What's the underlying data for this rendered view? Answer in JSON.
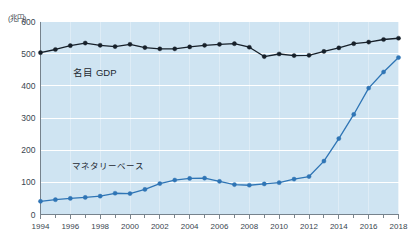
{
  "chart_data": {
    "type": "line",
    "title": "",
    "subtitle": "",
    "unit_label": "(兆円)",
    "xlabel": "",
    "ylabel": "",
    "ylim": [
      0,
      600
    ],
    "yticks": [
      0,
      100,
      200,
      300,
      400,
      500,
      600
    ],
    "ytick_labels": [
      "0",
      "100",
      "200",
      "300",
      "400",
      "500",
      "600"
    ],
    "xlim": [
      1994,
      2018
    ],
    "x": [
      1994,
      1995,
      1996,
      1997,
      1998,
      1999,
      2000,
      2001,
      2002,
      2003,
      2004,
      2005,
      2006,
      2007,
      2008,
      2009,
      2010,
      2011,
      2012,
      2013,
      2014,
      2015,
      2016,
      2017,
      2018
    ],
    "xticks": [
      1994,
      1996,
      1998,
      2000,
      2002,
      2004,
      2006,
      2008,
      2010,
      2012,
      2014,
      2016,
      2018
    ],
    "xtick_labels": [
      "1994",
      "1996",
      "1998",
      "2000",
      "2002",
      "2004",
      "2006",
      "2008",
      "2010",
      "2012",
      "2014",
      "2016",
      "2018"
    ],
    "minor_xticks_every": 1,
    "grid": true,
    "grid_color": "#ffffff",
    "plot_background": "#cfe4f2",
    "legend": "annotations",
    "series": [
      {
        "name": "名目 GDP",
        "color": "#17202a",
        "marker": "circle",
        "annotation": "名目 GDP",
        "annotation_x": 1996.2,
        "annotation_y": 432,
        "values": [
          503,
          513,
          525,
          533,
          526,
          522,
          529,
          519,
          515,
          515,
          521,
          526,
          529,
          531,
          520,
          491,
          499,
          494,
          495,
          507,
          518,
          531,
          536,
          544,
          548
        ]
      },
      {
        "name": "マネタリーベース",
        "color": "#2f75b5",
        "marker": "circle",
        "annotation": "マネタリーベース",
        "annotation_x": 1996.1,
        "annotation_y": 140,
        "values": [
          41,
          46,
          50,
          53,
          57,
          66,
          65,
          78,
          96,
          107,
          112,
          113,
          103,
          93,
          91,
          95,
          99,
          110,
          118,
          166,
          236,
          311,
          393,
          443,
          488
        ]
      }
    ]
  }
}
